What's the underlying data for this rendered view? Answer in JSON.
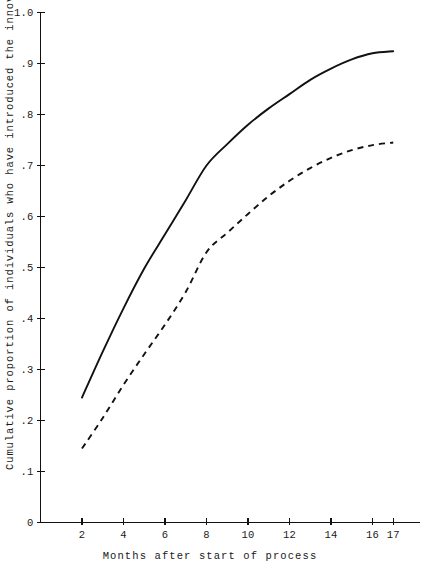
{
  "chart_data": {
    "type": "line",
    "title": "",
    "xlabel": "Months after start of process",
    "ylabel": "Cumulative proportion of individuals who have introduced the innovation",
    "xlim": [
      0,
      19
    ],
    "ylim": [
      0,
      1.0
    ],
    "grid": false,
    "legend": "none",
    "x_ticks": [
      2,
      4,
      6,
      8,
      10,
      12,
      14,
      16,
      17
    ],
    "x_tick_labels": [
      "2",
      "4",
      "6",
      "8",
      "10",
      "12",
      "14",
      "16",
      "17"
    ],
    "y_ticks": [
      0,
      0.1,
      0.2,
      0.3,
      0.4,
      0.5,
      0.6,
      0.7,
      0.8,
      0.9,
      1.0
    ],
    "y_tick_labels": [
      "0",
      ".1",
      ".2",
      ".3",
      ".4",
      ".5",
      ".6",
      ".7",
      ".8",
      ".9",
      "1.0"
    ],
    "x": [
      2,
      3,
      4,
      5,
      6,
      7,
      8,
      9,
      10,
      11,
      12,
      13,
      14,
      15,
      16,
      17
    ],
    "series": [
      {
        "name": "solid-curve",
        "style": "solid",
        "color": "#111111",
        "values": [
          0.245,
          0.335,
          0.42,
          0.498,
          0.565,
          0.632,
          0.7,
          0.742,
          0.78,
          0.812,
          0.84,
          0.868,
          0.89,
          0.908,
          0.92,
          0.924
        ]
      },
      {
        "name": "dashed-curve",
        "style": "dashed",
        "color": "#111111",
        "values": [
          0.145,
          0.205,
          0.27,
          0.33,
          0.388,
          0.452,
          0.53,
          0.568,
          0.605,
          0.64,
          0.67,
          0.695,
          0.715,
          0.73,
          0.74,
          0.745
        ]
      }
    ]
  },
  "axes": {
    "x_title": "Months after start of process",
    "y_title": "Cumulative proportion of individuals who have introduced the innovation"
  }
}
